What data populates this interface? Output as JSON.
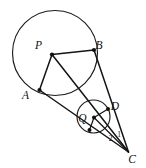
{
  "figure": {
    "canvas": {
      "width": 146,
      "height": 168,
      "background": "#ffffff"
    },
    "style": {
      "line_color": "#141414",
      "curve_color": "#1b1b1b",
      "dot_color": "#101010",
      "label_color": "#111111"
    },
    "circles": [
      {
        "id": "circle-P",
        "center_label": "P",
        "cx": 55,
        "cy": 53,
        "r": 42.5
      },
      {
        "id": "circle-Q",
        "center_label": "Q",
        "cx": 93.5,
        "cy": 116.5,
        "r": 16.5
      }
    ],
    "points": [
      {
        "id": "P",
        "label": "P",
        "x": 52,
        "y": 54.5,
        "label_x": 38.5,
        "label_y": 48.5
      },
      {
        "id": "B",
        "label": "B",
        "x": 94,
        "y": 50,
        "label_x": 99,
        "label_y": 49
      },
      {
        "id": "A",
        "label": "A",
        "x": 39.5,
        "y": 90,
        "label_x": 25.5,
        "label_y": 99
      },
      {
        "id": "Q",
        "label": "Q",
        "x": 94,
        "y": 117.5,
        "label_x": 82.5,
        "label_y": 121.5
      },
      {
        "id": "D",
        "label": "D",
        "x": 108,
        "y": 109,
        "label_x": 115,
        "label_y": 110
      },
      {
        "id": "C",
        "label": "C",
        "x": 128.5,
        "y": 152,
        "label_x": 132,
        "label_y": 163
      },
      {
        "id": "T",
        "label": "",
        "x": 89.5,
        "y": 130,
        "label_x": 0,
        "label_y": 0
      }
    ],
    "segments": [
      {
        "id": "seg-P-B",
        "from": "P",
        "to": "B"
      },
      {
        "id": "seg-P-A",
        "from": "P",
        "to": "A"
      },
      {
        "id": "seg-P-C",
        "from": "P",
        "to": "C"
      },
      {
        "id": "seg-B-C",
        "from": "B",
        "to": "C"
      },
      {
        "id": "seg-A-C",
        "from": "A",
        "to": "C"
      },
      {
        "id": "seg-Q-D",
        "from": "Q",
        "to": "D"
      },
      {
        "id": "seg-Q-T",
        "from": "Q",
        "to": "T"
      },
      {
        "id": "seg-Q-C",
        "from": "Q",
        "to": "C"
      }
    ],
    "angle_labels": [
      {
        "id": "angle-2",
        "text": "2",
        "x": 110.5,
        "y": 141
      },
      {
        "id": "angle-1",
        "text": "1",
        "x": 119,
        "y": 137
      }
    ]
  }
}
